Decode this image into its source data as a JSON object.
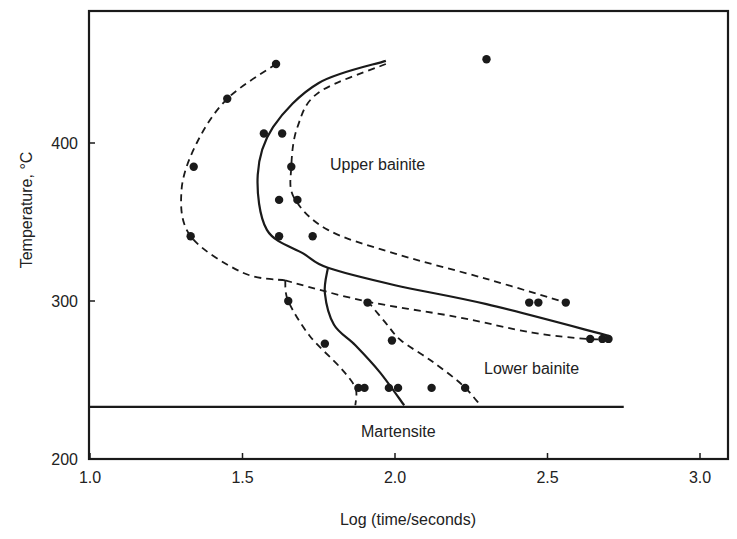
{
  "chart_data": {
    "type": "scatter",
    "title": "",
    "xlabel": "Log (time/seconds)",
    "ylabel": "Temperature, °C",
    "xlim": [
      1.0,
      3.0
    ],
    "ylim": [
      200,
      480
    ],
    "x_ticks": [
      "1.0",
      "1.5",
      "2.0",
      "2.5",
      "3.0"
    ],
    "y_ticks": [
      "200",
      "300",
      "400"
    ],
    "grid": false,
    "legend": null,
    "annotations": [
      {
        "text": "Upper bainite",
        "x": 1.78,
        "y": 385
      },
      {
        "text": "Lower bainite",
        "x": 2.3,
        "y": 258
      },
      {
        "text": "Martensite",
        "x": 1.9,
        "y": 218
      }
    ],
    "martensite_start_line": {
      "y": 233,
      "x_from": 1.0,
      "x_to": 2.75
    },
    "series": [
      {
        "name": "Outer dashed boundary (start, upper)",
        "style": "dashed",
        "points": [
          [
            1.61,
            450
          ],
          [
            1.45,
            428
          ],
          [
            1.35,
            400
          ],
          [
            1.3,
            370
          ],
          [
            1.33,
            341
          ],
          [
            1.5,
            318
          ],
          [
            1.64,
            313
          ]
        ]
      },
      {
        "name": "Solid C-curve (bainite nose)",
        "style": "solid",
        "points": [
          [
            1.97,
            452
          ],
          [
            1.75,
            438
          ],
          [
            1.6,
            410
          ],
          [
            1.55,
            380
          ],
          [
            1.58,
            345
          ],
          [
            1.7,
            330
          ],
          [
            1.78,
            321
          ],
          [
            2.0,
            310
          ],
          [
            2.3,
            298
          ],
          [
            2.7,
            278
          ]
        ]
      },
      {
        "name": "Inner dashed boundary (finish, upper)",
        "style": "dashed",
        "points": [
          [
            1.97,
            450
          ],
          [
            1.75,
            432
          ],
          [
            1.68,
            410
          ],
          [
            1.66,
            385
          ],
          [
            1.67,
            365
          ],
          [
            1.78,
            345
          ],
          [
            2.0,
            330
          ],
          [
            2.3,
            314
          ],
          [
            2.56,
            299
          ]
        ]
      },
      {
        "name": "Lower dashed boundary (to 2.7)",
        "style": "dashed",
        "points": [
          [
            1.64,
            313
          ],
          [
            1.9,
            300
          ],
          [
            2.2,
            290
          ],
          [
            2.45,
            280
          ],
          [
            2.63,
            276
          ],
          [
            2.7,
            276
          ]
        ]
      },
      {
        "name": "Lower bainite start (dashed)",
        "style": "dashed",
        "points": [
          [
            1.64,
            313
          ],
          [
            1.65,
            300
          ],
          [
            1.72,
            278
          ],
          [
            1.82,
            258
          ],
          [
            1.87,
            245
          ],
          [
            1.87,
            234
          ]
        ]
      },
      {
        "name": "Lower bainite solid boundary",
        "style": "solid",
        "points": [
          [
            1.78,
            321
          ],
          [
            1.77,
            305
          ],
          [
            1.8,
            285
          ],
          [
            1.87,
            272
          ],
          [
            1.95,
            255
          ],
          [
            2.03,
            234
          ]
        ]
      },
      {
        "name": "Lower bainite finish (dashed)",
        "style": "dashed",
        "points": [
          [
            1.91,
            300
          ],
          [
            1.97,
            286
          ],
          [
            2.02,
            275
          ],
          [
            2.12,
            262
          ],
          [
            2.22,
            247
          ],
          [
            2.28,
            234
          ]
        ]
      }
    ],
    "data_points": [
      [
        1.61,
        450
      ],
      [
        2.3,
        453
      ],
      [
        1.45,
        428
      ],
      [
        1.57,
        406
      ],
      [
        1.63,
        406
      ],
      [
        1.34,
        385
      ],
      [
        1.66,
        385
      ],
      [
        1.62,
        364
      ],
      [
        1.68,
        364
      ],
      [
        1.33,
        341
      ],
      [
        1.62,
        341
      ],
      [
        1.73,
        341
      ],
      [
        1.65,
        300
      ],
      [
        1.91,
        299
      ],
      [
        2.44,
        299
      ],
      [
        2.47,
        299
      ],
      [
        2.56,
        299
      ],
      [
        2.64,
        276
      ],
      [
        2.68,
        276
      ],
      [
        2.7,
        276
      ],
      [
        1.99,
        275
      ],
      [
        1.77,
        273
      ],
      [
        1.88,
        245
      ],
      [
        1.9,
        245
      ],
      [
        1.98,
        245
      ],
      [
        2.01,
        245
      ],
      [
        2.12,
        245
      ],
      [
        2.23,
        245
      ]
    ]
  }
}
